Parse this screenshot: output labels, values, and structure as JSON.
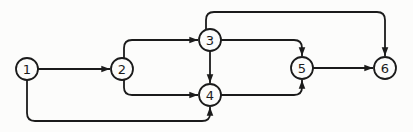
{
  "figure": {
    "type": "directed-graph",
    "ink_color": "#1b1b1b",
    "background_color": "#fcfcfb",
    "node_fill_color": "#fcfcfb",
    "node_radius": 11,
    "corner_radius": 8,
    "nodes": [
      {
        "id": "1",
        "label": "1",
        "x": 27,
        "y": 69
      },
      {
        "id": "2",
        "label": "2",
        "x": 122,
        "y": 69
      },
      {
        "id": "3",
        "label": "3",
        "x": 210,
        "y": 40
      },
      {
        "id": "4",
        "label": "4",
        "x": 210,
        "y": 95
      },
      {
        "id": "5",
        "label": "5",
        "x": 302,
        "y": 68
      },
      {
        "id": "6",
        "label": "6",
        "x": 385,
        "y": 68
      }
    ],
    "edges": [
      {
        "from": "1",
        "to": "2",
        "points": [
          [
            38,
            69
          ],
          [
            110,
            69
          ]
        ]
      },
      {
        "from": "1",
        "to": "4",
        "points": [
          [
            27,
            80
          ],
          [
            27,
            121
          ],
          [
            210,
            121
          ],
          [
            210,
            107
          ]
        ]
      },
      {
        "from": "2",
        "to": "3",
        "points": [
          [
            124,
            58
          ],
          [
            124,
            40
          ],
          [
            198,
            40
          ]
        ]
      },
      {
        "from": "2",
        "to": "4",
        "points": [
          [
            124,
            80
          ],
          [
            124,
            95
          ],
          [
            198,
            95
          ]
        ]
      },
      {
        "from": "3",
        "to": "4",
        "points": [
          [
            210,
            51
          ],
          [
            210,
            83
          ]
        ]
      },
      {
        "from": "3",
        "to": "5",
        "points": [
          [
            221,
            40
          ],
          [
            302,
            40
          ],
          [
            302,
            56
          ]
        ]
      },
      {
        "from": "3",
        "to": "6",
        "points": [
          [
            206,
            30
          ],
          [
            206,
            12
          ],
          [
            385,
            12
          ],
          [
            385,
            56
          ]
        ]
      },
      {
        "from": "4",
        "to": "5",
        "points": [
          [
            221,
            95
          ],
          [
            302,
            95
          ],
          [
            302,
            80
          ]
        ]
      },
      {
        "from": "5",
        "to": "6",
        "points": [
          [
            313,
            68
          ],
          [
            373,
            68
          ]
        ]
      }
    ]
  }
}
